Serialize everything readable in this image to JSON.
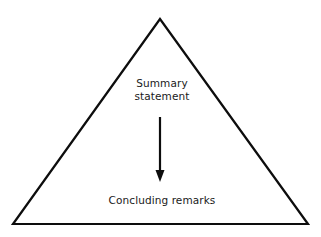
{
  "diagram": {
    "background_color": "#ffffff",
    "stroke_color": "#0d0d0d",
    "text_color": "#1a1a1a",
    "shape": {
      "name": "triangle",
      "type": "outlined-triangle",
      "apex": [
        160,
        19
      ],
      "bottom_left": [
        13,
        224
      ],
      "bottom_right": [
        308,
        224
      ],
      "stroke_width": 2.2,
      "fill": "none"
    },
    "arrow": {
      "name": "down-arrow",
      "direction": "down",
      "x": 160,
      "y_start": 117,
      "y_end": 182,
      "shaft_width": 2.2,
      "head_width": 9,
      "head_height": 12,
      "color": "#0d0d0d"
    },
    "labels": {
      "summary": {
        "line1": "Summary",
        "line2": "statement"
      },
      "concluding": "Concluding remarks"
    }
  }
}
